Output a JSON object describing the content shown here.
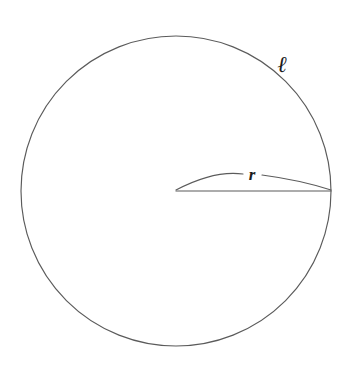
{
  "figure": {
    "canvas": {
      "width": 352,
      "height": 377,
      "background": "#ffffff"
    },
    "stroke_color": "#5b5b5b",
    "label_color": "#1c1c1c",
    "circle": {
      "name": "circle-outline",
      "center_x": 176,
      "center_y": 191,
      "radius": 155
    },
    "radius_segment": {
      "name": "radius-line",
      "x1": 176,
      "y1": 191,
      "x2": 331,
      "y2": 191
    },
    "arc_segment": {
      "name": "radius-arc",
      "x1": 176,
      "y1": 190,
      "x2": 331,
      "y2": 190,
      "peak_x": 252,
      "peak_y": 176,
      "path_left": "M 176 190 Q 214 170 243 174",
      "path_right": "M 262 175 Q 300 180 331 190"
    },
    "labels": {
      "radius": {
        "name": "radius-label",
        "text": "r",
        "x": 252,
        "y": 180
      },
      "circumference": {
        "name": "circumference-label",
        "text": "ℓ",
        "x": 282,
        "y": 72
      }
    }
  }
}
